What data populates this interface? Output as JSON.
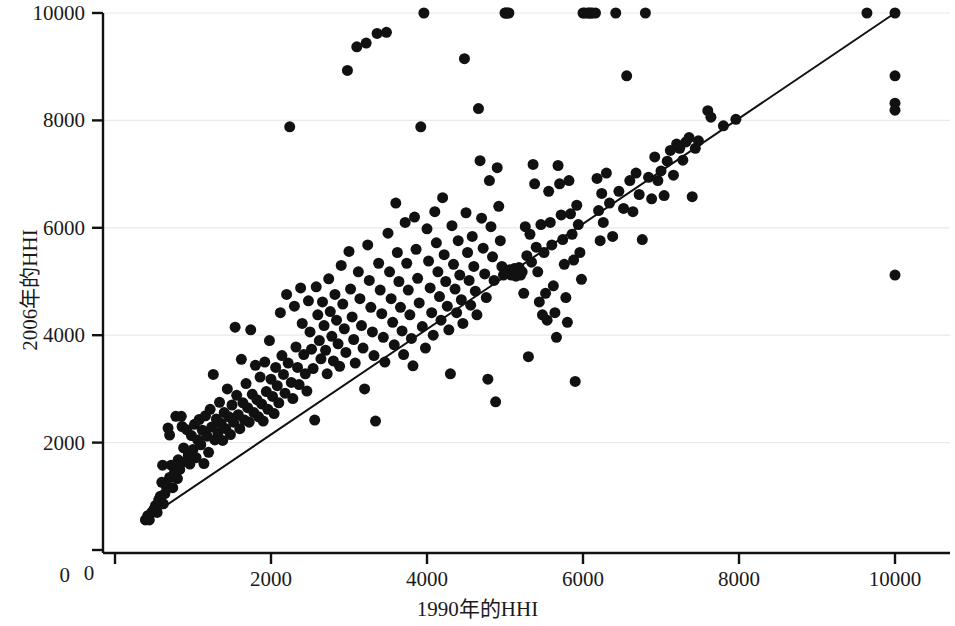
{
  "chart_data": {
    "type": "scatter",
    "title": "",
    "xlabel": "1990年的HHI",
    "ylabel": "2006年的HHI",
    "xlim": [
      0,
      10400
    ],
    "ylim": [
      0,
      10250
    ],
    "xticks": [
      0,
      2000,
      4000,
      6000,
      8000,
      10000
    ],
    "yticks": [
      0,
      2000,
      4000,
      6000,
      8000,
      10000
    ],
    "xtick_labels": [
      "0",
      "2000",
      "4000",
      "6000",
      "8000",
      "10000"
    ],
    "ytick_labels": [
      "0",
      "2000",
      "4000",
      "6000",
      "8000",
      "10000"
    ],
    "grid": "horizontal-faint",
    "legend": "none",
    "marker_color": "#111111",
    "marker_size": 11,
    "reference_line": {
      "name": "45-degree identity line",
      "color": "#111111",
      "width": 2,
      "x": [
        380,
        10000
      ],
      "y": [
        560,
        10000
      ]
    },
    "points": [
      [
        390,
        560
      ],
      [
        420,
        640
      ],
      [
        440,
        560
      ],
      [
        470,
        700
      ],
      [
        500,
        760
      ],
      [
        520,
        830
      ],
      [
        540,
        700
      ],
      [
        560,
        930
      ],
      [
        580,
        1000
      ],
      [
        600,
        1260
      ],
      [
        610,
        1580
      ],
      [
        620,
        860
      ],
      [
        640,
        1050
      ],
      [
        660,
        1180
      ],
      [
        680,
        2270
      ],
      [
        700,
        1350
      ],
      [
        700,
        2140
      ],
      [
        720,
        1580
      ],
      [
        740,
        1160
      ],
      [
        760,
        1430
      ],
      [
        780,
        2490
      ],
      [
        800,
        1330
      ],
      [
        810,
        1680
      ],
      [
        830,
        1500
      ],
      [
        850,
        2490
      ],
      [
        860,
        2300
      ],
      [
        880,
        1900
      ],
      [
        900,
        1650
      ],
      [
        920,
        2240
      ],
      [
        940,
        1770
      ],
      [
        960,
        1600
      ],
      [
        980,
        2130
      ],
      [
        1000,
        1870
      ],
      [
        1020,
        2340
      ],
      [
        1040,
        1720
      ],
      [
        1060,
        2050
      ],
      [
        1080,
        2430
      ],
      [
        1100,
        1960
      ],
      [
        1120,
        2230
      ],
      [
        1140,
        1610
      ],
      [
        1160,
        2500
      ],
      [
        1180,
        2120
      ],
      [
        1200,
        1820
      ],
      [
        1220,
        2620
      ],
      [
        1240,
        2290
      ],
      [
        1260,
        3270
      ],
      [
        1280,
        2050
      ],
      [
        1300,
        2440
      ],
      [
        1320,
        2180
      ],
      [
        1340,
        2750
      ],
      [
        1360,
        2360
      ],
      [
        1380,
        2040
      ],
      [
        1400,
        2560
      ],
      [
        1420,
        2260
      ],
      [
        1440,
        3000
      ],
      [
        1460,
        2480
      ],
      [
        1480,
        2150
      ],
      [
        1500,
        2700
      ],
      [
        1520,
        2380
      ],
      [
        1540,
        4150
      ],
      [
        1560,
        2880
      ],
      [
        1580,
        2520
      ],
      [
        1600,
        2260
      ],
      [
        1620,
        3550
      ],
      [
        1640,
        2740
      ],
      [
        1660,
        2420
      ],
      [
        1680,
        3100
      ],
      [
        1700,
        2650
      ],
      [
        1720,
        2380
      ],
      [
        1740,
        4100
      ],
      [
        1760,
        2900
      ],
      [
        1780,
        2560
      ],
      [
        1800,
        3440
      ],
      [
        1820,
        2800
      ],
      [
        1840,
        2480
      ],
      [
        1860,
        3220
      ],
      [
        1880,
        2720
      ],
      [
        1900,
        2400
      ],
      [
        1920,
        3500
      ],
      [
        1940,
        2950
      ],
      [
        1960,
        2620
      ],
      [
        1980,
        3900
      ],
      [
        2000,
        3180
      ],
      [
        2020,
        2860
      ],
      [
        2040,
        2540
      ],
      [
        2060,
        3400
      ],
      [
        2080,
        3060
      ],
      [
        2100,
        2740
      ],
      [
        2120,
        4420
      ],
      [
        2140,
        3620
      ],
      [
        2160,
        3270
      ],
      [
        2180,
        2920
      ],
      [
        2200,
        4760
      ],
      [
        2220,
        3480
      ],
      [
        2240,
        7880
      ],
      [
        2260,
        3120
      ],
      [
        2280,
        2820
      ],
      [
        2300,
        4540
      ],
      [
        2320,
        3780
      ],
      [
        2340,
        3400
      ],
      [
        2360,
        3080
      ],
      [
        2380,
        4880
      ],
      [
        2400,
        4220
      ],
      [
        2420,
        3640
      ],
      [
        2440,
        3280
      ],
      [
        2460,
        2960
      ],
      [
        2480,
        4640
      ],
      [
        2500,
        4060
      ],
      [
        2520,
        3740
      ],
      [
        2540,
        3380
      ],
      [
        2560,
        2420
      ],
      [
        2580,
        4900
      ],
      [
        2600,
        4380
      ],
      [
        2620,
        3900
      ],
      [
        2640,
        3560
      ],
      [
        2660,
        4620
      ],
      [
        2680,
        4180
      ],
      [
        2700,
        3720
      ],
      [
        2720,
        3280
      ],
      [
        2740,
        5050
      ],
      [
        2760,
        4440
      ],
      [
        2780,
        3980
      ],
      [
        2800,
        3520
      ],
      [
        2820,
        4760
      ],
      [
        2840,
        4280
      ],
      [
        2860,
        3840
      ],
      [
        2880,
        3420
      ],
      [
        2900,
        5300
      ],
      [
        2920,
        4580
      ],
      [
        2940,
        4120
      ],
      [
        2960,
        3680
      ],
      [
        2980,
        8930
      ],
      [
        3000,
        5560
      ],
      [
        3020,
        4860
      ],
      [
        3040,
        4340
      ],
      [
        3060,
        3920
      ],
      [
        3080,
        3480
      ],
      [
        3100,
        9370
      ],
      [
        3120,
        5180
      ],
      [
        3140,
        4680
      ],
      [
        3160,
        4180
      ],
      [
        3180,
        3760
      ],
      [
        3200,
        3000
      ],
      [
        3220,
        9440
      ],
      [
        3240,
        5680
      ],
      [
        3260,
        5020
      ],
      [
        3280,
        4520
      ],
      [
        3300,
        4060
      ],
      [
        3320,
        3620
      ],
      [
        3340,
        2400
      ],
      [
        3360,
        9620
      ],
      [
        3380,
        5340
      ],
      [
        3400,
        4840
      ],
      [
        3420,
        4400
      ],
      [
        3440,
        3960
      ],
      [
        3460,
        3500
      ],
      [
        3480,
        9640
      ],
      [
        3500,
        5900
      ],
      [
        3520,
        5180
      ],
      [
        3540,
        4680
      ],
      [
        3560,
        4240
      ],
      [
        3580,
        3820
      ],
      [
        3600,
        6460
      ],
      [
        3620,
        5540
      ],
      [
        3640,
        5000
      ],
      [
        3660,
        4520
      ],
      [
        3680,
        4080
      ],
      [
        3700,
        3640
      ],
      [
        3720,
        6100
      ],
      [
        3740,
        5340
      ],
      [
        3760,
        4840
      ],
      [
        3780,
        4380
      ],
      [
        3800,
        3940
      ],
      [
        3820,
        3430
      ],
      [
        3840,
        6200
      ],
      [
        3860,
        5600
      ],
      [
        3880,
        5060
      ],
      [
        3900,
        4600
      ],
      [
        3920,
        7880
      ],
      [
        3940,
        4160
      ],
      [
        3960,
        10000
      ],
      [
        3980,
        3760
      ],
      [
        4000,
        5980
      ],
      [
        4020,
        5380
      ],
      [
        4040,
        4880
      ],
      [
        4060,
        4420
      ],
      [
        4080,
        4000
      ],
      [
        4100,
        6300
      ],
      [
        4120,
        5720
      ],
      [
        4140,
        5180
      ],
      [
        4160,
        4720
      ],
      [
        4180,
        4280
      ],
      [
        4200,
        6560
      ],
      [
        4220,
        5500
      ],
      [
        4240,
        5000
      ],
      [
        4260,
        4540
      ],
      [
        4280,
        4100
      ],
      [
        4300,
        3280
      ],
      [
        4320,
        6040
      ],
      [
        4340,
        5320
      ],
      [
        4360,
        4860
      ],
      [
        4380,
        4420
      ],
      [
        4400,
        5760
      ],
      [
        4420,
        5120
      ],
      [
        4440,
        4660
      ],
      [
        4460,
        4220
      ],
      [
        4480,
        9150
      ],
      [
        4500,
        6280
      ],
      [
        4520,
        5540
      ],
      [
        4540,
        5020
      ],
      [
        4560,
        4560
      ],
      [
        4580,
        5840
      ],
      [
        4600,
        5280
      ],
      [
        4620,
        4820
      ],
      [
        4640,
        4380
      ],
      [
        4660,
        8220
      ],
      [
        4680,
        7250
      ],
      [
        4700,
        6180
      ],
      [
        4720,
        5620
      ],
      [
        4740,
        5140
      ],
      [
        4760,
        4700
      ],
      [
        4780,
        3180
      ],
      [
        4800,
        6880
      ],
      [
        4820,
        6020
      ],
      [
        4840,
        5460
      ],
      [
        4860,
        5020
      ],
      [
        4880,
        2760
      ],
      [
        4900,
        7120
      ],
      [
        4920,
        6400
      ],
      [
        4940,
        5760
      ],
      [
        4960,
        5280
      ],
      [
        4980,
        5120
      ],
      [
        5000,
        10000
      ],
      [
        5010,
        10000
      ],
      [
        5030,
        10000
      ],
      [
        5050,
        10000
      ],
      [
        5060,
        5220
      ],
      [
        5080,
        5120
      ],
      [
        5100,
        5180
      ],
      [
        5120,
        5240
      ],
      [
        5140,
        5100
      ],
      [
        5160,
        5160
      ],
      [
        5180,
        5260
      ],
      [
        5200,
        5120
      ],
      [
        5220,
        5180
      ],
      [
        5240,
        4780
      ],
      [
        5260,
        6020
      ],
      [
        5280,
        5480
      ],
      [
        5300,
        3600
      ],
      [
        5320,
        5880
      ],
      [
        5340,
        5360
      ],
      [
        5360,
        7180
      ],
      [
        5380,
        6820
      ],
      [
        5400,
        5640
      ],
      [
        5420,
        5180
      ],
      [
        5440,
        4620
      ],
      [
        5460,
        6060
      ],
      [
        5480,
        4380
      ],
      [
        5500,
        5540
      ],
      [
        5520,
        4780
      ],
      [
        5540,
        4280
      ],
      [
        5560,
        6680
      ],
      [
        5580,
        6100
      ],
      [
        5600,
        5680
      ],
      [
        5620,
        4920
      ],
      [
        5640,
        4420
      ],
      [
        5660,
        3960
      ],
      [
        5680,
        7160
      ],
      [
        5700,
        6820
      ],
      [
        5720,
        6240
      ],
      [
        5740,
        5780
      ],
      [
        5760,
        5320
      ],
      [
        5780,
        4700
      ],
      [
        5800,
        4240
      ],
      [
        5820,
        6880
      ],
      [
        5840,
        6260
      ],
      [
        5860,
        5880
      ],
      [
        5880,
        5400
      ],
      [
        5900,
        3140
      ],
      [
        5920,
        6420
      ],
      [
        5940,
        6060
      ],
      [
        5960,
        5540
      ],
      [
        5980,
        5040
      ],
      [
        6000,
        10000
      ],
      [
        6020,
        10000
      ],
      [
        6060,
        10000
      ],
      [
        6080,
        10000
      ],
      [
        6100,
        10000
      ],
      [
        6120,
        10000
      ],
      [
        6160,
        10000
      ],
      [
        6180,
        6920
      ],
      [
        6200,
        6320
      ],
      [
        6220,
        5760
      ],
      [
        6240,
        6640
      ],
      [
        6260,
        6100
      ],
      [
        6300,
        7020
      ],
      [
        6340,
        6460
      ],
      [
        6380,
        5840
      ],
      [
        6420,
        10000
      ],
      [
        6460,
        6680
      ],
      [
        6520,
        6360
      ],
      [
        6560,
        8830
      ],
      [
        6600,
        6880
      ],
      [
        6640,
        6300
      ],
      [
        6680,
        7020
      ],
      [
        6720,
        6620
      ],
      [
        6760,
        5780
      ],
      [
        6800,
        10000
      ],
      [
        6840,
        6940
      ],
      [
        6880,
        6540
      ],
      [
        6920,
        7320
      ],
      [
        6960,
        6880
      ],
      [
        7000,
        7060
      ],
      [
        7040,
        6600
      ],
      [
        7080,
        7240
      ],
      [
        7120,
        7440
      ],
      [
        7160,
        6980
      ],
      [
        7200,
        7560
      ],
      [
        7240,
        7480
      ],
      [
        7280,
        7260
      ],
      [
        7320,
        7600
      ],
      [
        7360,
        7680
      ],
      [
        7400,
        6580
      ],
      [
        7440,
        7480
      ],
      [
        7480,
        7620
      ],
      [
        7600,
        8180
      ],
      [
        7640,
        8060
      ],
      [
        7800,
        7900
      ],
      [
        7960,
        8020
      ],
      [
        9640,
        10000
      ],
      [
        10000,
        10000
      ],
      [
        10000,
        8830
      ],
      [
        10000,
        8320
      ],
      [
        10000,
        8190
      ],
      [
        10000,
        5120
      ]
    ]
  }
}
